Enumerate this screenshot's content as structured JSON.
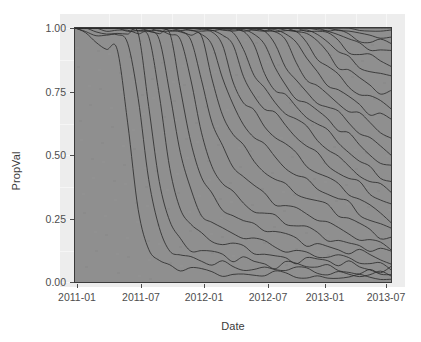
{
  "chart": {
    "type": "area",
    "title": "",
    "xlabel": "Date",
    "ylabel": "PropVal",
    "background_color": "#ffffff",
    "panel_color": "#8f8f8f",
    "line_color": "#2b2b2b",
    "axis_text_color": "#4d4d4d"
  },
  "y_axis": {
    "label": "PropVal",
    "ticks": [
      {
        "label": "1.00",
        "value": 1.0,
        "y_px": 28
      },
      {
        "label": "0.75",
        "value": 0.75,
        "y_px": 92
      },
      {
        "label": "0.50",
        "value": 0.5,
        "y_px": 155
      },
      {
        "label": "0.25",
        "value": 0.25,
        "y_px": 219
      },
      {
        "label": "0.00",
        "value": 0.0,
        "y_px": 282
      }
    ],
    "limits": [
      0.0,
      1.0
    ]
  },
  "x_axis": {
    "label": "Date",
    "ticks": [
      {
        "label": "2011-01",
        "x_px": 77
      },
      {
        "label": "2011-07",
        "x_px": 141
      },
      {
        "label": "2012-01",
        "x_px": 204
      },
      {
        "label": "2012-07",
        "x_px": 268
      },
      {
        "label": "2013-01",
        "x_px": 325
      },
      {
        "label": "2013-07",
        "x_px": 386
      }
    ],
    "limits": [
      "2011-01",
      "2013-07"
    ]
  },
  "chart_data": {
    "type": "area",
    "title": "",
    "xlabel": "Date",
    "ylabel": "PropVal",
    "ylim": [
      0.0,
      1.0
    ],
    "xlim": [
      "2011-01",
      "2013-08"
    ],
    "grid": false,
    "legend": "none",
    "stacked": true,
    "normalized": true,
    "x": [
      "2011-01",
      "2011-02",
      "2011-03",
      "2011-04",
      "2011-05",
      "2011-06",
      "2011-07",
      "2011-08",
      "2011-09",
      "2011-10",
      "2011-11",
      "2011-12",
      "2012-01",
      "2012-02",
      "2012-03",
      "2012-04",
      "2012-05",
      "2012-06",
      "2012-07",
      "2012-08",
      "2012-09",
      "2012-10",
      "2012-11",
      "2012-12",
      "2013-01",
      "2013-02",
      "2013-03",
      "2013-04",
      "2013-05",
      "2013-06",
      "2013-07"
    ],
    "series": [
      {
        "name": "S01",
        "cum_top": [
          1.0,
          0.97,
          0.94,
          0.92,
          0.91,
          0.62,
          0.3,
          0.14,
          0.08,
          0.06,
          0.05,
          0.05,
          0.04,
          0.04,
          0.04,
          0.03,
          0.03,
          0.03,
          0.03,
          0.03,
          0.03,
          0.02,
          0.02,
          0.02,
          0.02,
          0.02,
          0.02,
          0.02,
          0.02,
          0.01,
          0.01
        ]
      },
      {
        "name": "S02",
        "cum_top": [
          1.0,
          0.99,
          0.97,
          0.96,
          0.96,
          0.95,
          0.72,
          0.4,
          0.22,
          0.14,
          0.1,
          0.09,
          0.08,
          0.07,
          0.07,
          0.06,
          0.06,
          0.06,
          0.05,
          0.05,
          0.05,
          0.05,
          0.04,
          0.04,
          0.04,
          0.04,
          0.03,
          0.03,
          0.03,
          0.03,
          0.02
        ]
      },
      {
        "name": "S03",
        "cum_top": [
          1.0,
          1.0,
          0.98,
          0.98,
          0.98,
          0.97,
          0.96,
          0.7,
          0.4,
          0.24,
          0.17,
          0.14,
          0.12,
          0.11,
          0.1,
          0.09,
          0.09,
          0.08,
          0.08,
          0.07,
          0.07,
          0.07,
          0.06,
          0.06,
          0.05,
          0.05,
          0.05,
          0.04,
          0.04,
          0.04,
          0.03
        ]
      },
      {
        "name": "S04",
        "cum_top": [
          1.0,
          1.0,
          1.0,
          0.99,
          0.99,
          0.99,
          0.98,
          0.96,
          0.72,
          0.45,
          0.3,
          0.23,
          0.19,
          0.17,
          0.15,
          0.14,
          0.13,
          0.12,
          0.11,
          0.1,
          0.1,
          0.09,
          0.09,
          0.08,
          0.08,
          0.07,
          0.07,
          0.06,
          0.06,
          0.05,
          0.05
        ]
      },
      {
        "name": "S05",
        "cum_top": [
          1.0,
          1.0,
          1.0,
          1.0,
          1.0,
          0.99,
          0.99,
          0.98,
          0.96,
          0.74,
          0.5,
          0.36,
          0.28,
          0.24,
          0.21,
          0.19,
          0.18,
          0.16,
          0.15,
          0.14,
          0.13,
          0.12,
          0.12,
          0.11,
          0.1,
          0.09,
          0.09,
          0.08,
          0.07,
          0.07,
          0.06
        ]
      },
      {
        "name": "S06",
        "cum_top": [
          1.0,
          1.0,
          1.0,
          1.0,
          1.0,
          1.0,
          0.99,
          0.99,
          0.98,
          0.96,
          0.76,
          0.55,
          0.41,
          0.34,
          0.3,
          0.27,
          0.24,
          0.22,
          0.21,
          0.19,
          0.18,
          0.17,
          0.16,
          0.15,
          0.14,
          0.13,
          0.12,
          0.11,
          0.1,
          0.09,
          0.08
        ]
      },
      {
        "name": "S07",
        "cum_top": [
          1.0,
          1.0,
          1.0,
          1.0,
          1.0,
          1.0,
          1.0,
          0.99,
          0.99,
          0.98,
          0.96,
          0.78,
          0.58,
          0.46,
          0.39,
          0.35,
          0.32,
          0.29,
          0.27,
          0.25,
          0.23,
          0.22,
          0.21,
          0.19,
          0.18,
          0.17,
          0.15,
          0.14,
          0.13,
          0.12,
          0.11
        ]
      },
      {
        "name": "S08",
        "cum_top": [
          1.0,
          1.0,
          1.0,
          1.0,
          1.0,
          1.0,
          1.0,
          1.0,
          0.99,
          0.99,
          0.98,
          0.96,
          0.8,
          0.62,
          0.52,
          0.46,
          0.42,
          0.38,
          0.35,
          0.32,
          0.3,
          0.28,
          0.26,
          0.25,
          0.23,
          0.21,
          0.2,
          0.18,
          0.16,
          0.15,
          0.13
        ]
      },
      {
        "name": "S09",
        "cum_top": [
          1.0,
          1.0,
          1.0,
          1.0,
          1.0,
          1.0,
          1.0,
          1.0,
          1.0,
          0.99,
          0.99,
          0.98,
          0.96,
          0.8,
          0.66,
          0.58,
          0.52,
          0.48,
          0.44,
          0.41,
          0.38,
          0.36,
          0.33,
          0.31,
          0.29,
          0.27,
          0.25,
          0.23,
          0.21,
          0.19,
          0.17
        ]
      },
      {
        "name": "S10",
        "cum_top": [
          1.0,
          1.0,
          1.0,
          1.0,
          1.0,
          1.0,
          1.0,
          1.0,
          1.0,
          1.0,
          0.99,
          0.99,
          0.98,
          0.95,
          0.8,
          0.69,
          0.62,
          0.57,
          0.53,
          0.49,
          0.46,
          0.43,
          0.4,
          0.37,
          0.35,
          0.32,
          0.3,
          0.27,
          0.25,
          0.23,
          0.21
        ]
      },
      {
        "name": "S11",
        "cum_top": [
          1.0,
          1.0,
          1.0,
          1.0,
          1.0,
          1.0,
          1.0,
          1.0,
          1.0,
          1.0,
          1.0,
          0.99,
          0.99,
          0.98,
          0.94,
          0.8,
          0.71,
          0.66,
          0.61,
          0.57,
          0.54,
          0.5,
          0.47,
          0.44,
          0.41,
          0.38,
          0.35,
          0.32,
          0.29,
          0.27,
          0.25
        ]
      },
      {
        "name": "S12",
        "cum_top": [
          1.0,
          1.0,
          1.0,
          1.0,
          1.0,
          1.0,
          1.0,
          1.0,
          1.0,
          1.0,
          1.0,
          1.0,
          0.99,
          0.99,
          0.98,
          0.93,
          0.81,
          0.74,
          0.69,
          0.65,
          0.61,
          0.57,
          0.54,
          0.5,
          0.47,
          0.44,
          0.41,
          0.38,
          0.35,
          0.32,
          0.3
        ]
      },
      {
        "name": "S13",
        "cum_top": [
          1.0,
          1.0,
          1.0,
          1.0,
          1.0,
          1.0,
          1.0,
          1.0,
          1.0,
          1.0,
          1.0,
          1.0,
          1.0,
          0.99,
          0.99,
          0.98,
          0.93,
          0.82,
          0.76,
          0.71,
          0.67,
          0.63,
          0.6,
          0.56,
          0.53,
          0.49,
          0.46,
          0.43,
          0.4,
          0.37,
          0.35
        ]
      },
      {
        "name": "S14",
        "cum_top": [
          1.0,
          1.0,
          1.0,
          1.0,
          1.0,
          1.0,
          1.0,
          1.0,
          1.0,
          1.0,
          1.0,
          1.0,
          1.0,
          1.0,
          0.99,
          0.99,
          0.98,
          0.93,
          0.83,
          0.77,
          0.73,
          0.69,
          0.65,
          0.62,
          0.58,
          0.55,
          0.52,
          0.48,
          0.45,
          0.42,
          0.4
        ]
      },
      {
        "name": "S15",
        "cum_top": [
          1.0,
          1.0,
          1.0,
          1.0,
          1.0,
          1.0,
          1.0,
          1.0,
          1.0,
          1.0,
          1.0,
          1.0,
          1.0,
          1.0,
          1.0,
          0.99,
          0.99,
          0.98,
          0.93,
          0.84,
          0.78,
          0.74,
          0.7,
          0.67,
          0.64,
          0.6,
          0.57,
          0.54,
          0.51,
          0.48,
          0.45
        ]
      },
      {
        "name": "S16",
        "cum_top": [
          1.0,
          1.0,
          1.0,
          1.0,
          1.0,
          1.0,
          1.0,
          1.0,
          1.0,
          1.0,
          1.0,
          1.0,
          1.0,
          1.0,
          1.0,
          1.0,
          0.99,
          0.99,
          0.98,
          0.94,
          0.85,
          0.79,
          0.75,
          0.72,
          0.69,
          0.66,
          0.62,
          0.59,
          0.56,
          0.53,
          0.51
        ]
      },
      {
        "name": "S17",
        "cum_top": [
          1.0,
          1.0,
          1.0,
          1.0,
          1.0,
          1.0,
          1.0,
          1.0,
          1.0,
          1.0,
          1.0,
          1.0,
          1.0,
          1.0,
          1.0,
          1.0,
          1.0,
          0.99,
          0.99,
          0.98,
          0.94,
          0.86,
          0.81,
          0.77,
          0.74,
          0.71,
          0.68,
          0.65,
          0.62,
          0.59,
          0.57
        ]
      },
      {
        "name": "S18",
        "cum_top": [
          1.0,
          1.0,
          1.0,
          1.0,
          1.0,
          1.0,
          1.0,
          1.0,
          1.0,
          1.0,
          1.0,
          1.0,
          1.0,
          1.0,
          1.0,
          1.0,
          1.0,
          1.0,
          0.99,
          0.99,
          0.98,
          0.94,
          0.87,
          0.82,
          0.79,
          0.76,
          0.73,
          0.7,
          0.67,
          0.65,
          0.63
        ]
      },
      {
        "name": "S19",
        "cum_top": [
          1.0,
          1.0,
          1.0,
          1.0,
          1.0,
          1.0,
          1.0,
          1.0,
          1.0,
          1.0,
          1.0,
          1.0,
          1.0,
          1.0,
          1.0,
          1.0,
          1.0,
          1.0,
          1.0,
          0.99,
          0.99,
          0.98,
          0.94,
          0.88,
          0.84,
          0.81,
          0.78,
          0.75,
          0.73,
          0.71,
          0.69
        ]
      },
      {
        "name": "S20",
        "cum_top": [
          1.0,
          1.0,
          1.0,
          1.0,
          1.0,
          1.0,
          1.0,
          1.0,
          1.0,
          1.0,
          1.0,
          1.0,
          1.0,
          1.0,
          1.0,
          1.0,
          1.0,
          1.0,
          1.0,
          1.0,
          0.99,
          0.99,
          0.98,
          0.94,
          0.89,
          0.85,
          0.83,
          0.8,
          0.78,
          0.76,
          0.75
        ]
      },
      {
        "name": "S21",
        "cum_top": [
          1.0,
          1.0,
          1.0,
          1.0,
          1.0,
          1.0,
          1.0,
          1.0,
          1.0,
          1.0,
          1.0,
          1.0,
          1.0,
          1.0,
          1.0,
          1.0,
          1.0,
          1.0,
          1.0,
          1.0,
          1.0,
          0.99,
          0.99,
          0.98,
          0.95,
          0.9,
          0.87,
          0.85,
          0.83,
          0.82,
          0.81
        ]
      },
      {
        "name": "S22",
        "cum_top": [
          1.0,
          1.0,
          1.0,
          1.0,
          1.0,
          1.0,
          1.0,
          1.0,
          1.0,
          1.0,
          1.0,
          1.0,
          1.0,
          1.0,
          1.0,
          1.0,
          1.0,
          1.0,
          1.0,
          1.0,
          1.0,
          1.0,
          0.99,
          0.99,
          0.98,
          0.95,
          0.91,
          0.89,
          0.88,
          0.87,
          0.86
        ]
      },
      {
        "name": "S23",
        "cum_top": [
          1.0,
          1.0,
          1.0,
          1.0,
          1.0,
          1.0,
          1.0,
          1.0,
          1.0,
          1.0,
          1.0,
          1.0,
          1.0,
          1.0,
          1.0,
          1.0,
          1.0,
          1.0,
          1.0,
          1.0,
          1.0,
          1.0,
          1.0,
          0.99,
          0.99,
          0.98,
          0.96,
          0.93,
          0.92,
          0.91,
          0.9
        ]
      },
      {
        "name": "S24",
        "cum_top": [
          1.0,
          1.0,
          1.0,
          1.0,
          1.0,
          1.0,
          1.0,
          1.0,
          1.0,
          1.0,
          1.0,
          1.0,
          1.0,
          1.0,
          1.0,
          1.0,
          1.0,
          1.0,
          1.0,
          1.0,
          1.0,
          1.0,
          1.0,
          1.0,
          0.99,
          0.99,
          0.98,
          0.96,
          0.95,
          0.94,
          0.94
        ]
      },
      {
        "name": "S25",
        "cum_top": [
          1.0,
          1.0,
          1.0,
          1.0,
          1.0,
          1.0,
          1.0,
          1.0,
          1.0,
          1.0,
          1.0,
          1.0,
          1.0,
          1.0,
          1.0,
          1.0,
          1.0,
          1.0,
          1.0,
          1.0,
          1.0,
          1.0,
          1.0,
          1.0,
          1.0,
          0.99,
          0.99,
          0.98,
          0.97,
          0.97,
          0.97
        ]
      },
      {
        "name": "S26",
        "cum_top": [
          1.0,
          1.0,
          1.0,
          1.0,
          1.0,
          1.0,
          1.0,
          1.0,
          1.0,
          1.0,
          1.0,
          1.0,
          1.0,
          1.0,
          1.0,
          1.0,
          1.0,
          1.0,
          1.0,
          1.0,
          1.0,
          1.0,
          1.0,
          1.0,
          1.0,
          1.0,
          1.0,
          0.99,
          0.99,
          0.99,
          0.99
        ]
      },
      {
        "name": "S27",
        "cum_top": [
          1.0,
          1.0,
          1.0,
          1.0,
          1.0,
          1.0,
          1.0,
          1.0,
          1.0,
          1.0,
          1.0,
          1.0,
          1.0,
          1.0,
          1.0,
          1.0,
          1.0,
          1.0,
          1.0,
          1.0,
          1.0,
          1.0,
          1.0,
          1.0,
          1.0,
          1.0,
          1.0,
          1.0,
          1.0,
          1.0,
          1.0
        ]
      }
    ]
  },
  "panel_geometry": {
    "left_px": 74,
    "top_px": 27,
    "width_px": 318,
    "height_px": 256
  }
}
